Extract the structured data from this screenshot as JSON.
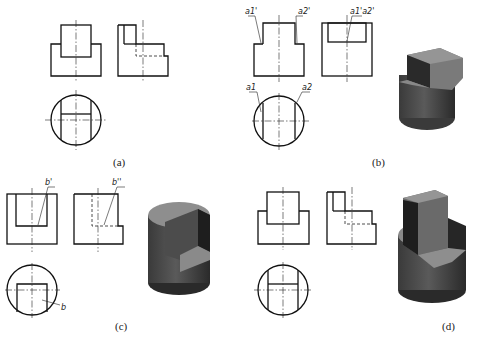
{
  "header_text_clipped": "(clipped line of text)",
  "figures": [
    {
      "id": "a",
      "caption": "(a)",
      "labels": []
    },
    {
      "id": "b",
      "caption": "(b)",
      "labels": [
        "a1'",
        "a2'",
        "a1'a2'",
        "a1",
        "a2"
      ]
    },
    {
      "id": "c",
      "caption": "(c)",
      "labels": [
        "b'",
        "b''",
        "b"
      ]
    },
    {
      "id": "d",
      "caption": "(d)",
      "labels": []
    }
  ],
  "colors": {
    "line": "#111111",
    "solid_light": "#8c8c8c",
    "solid_mid": "#6a6a6a",
    "solid_dark": "#2e2e2e"
  }
}
